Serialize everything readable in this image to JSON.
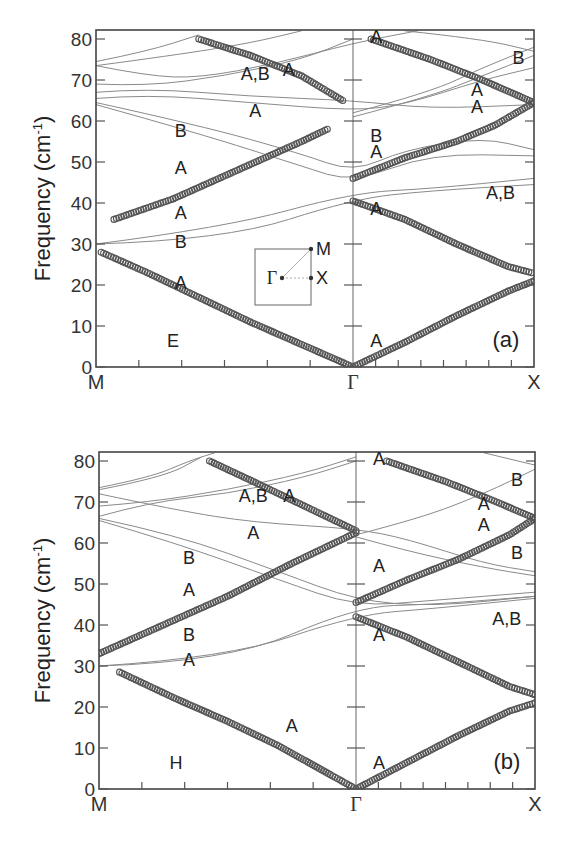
{
  "figure": {
    "caption_visible": false,
    "y_axis_label": "Frequency (cm",
    "y_axis_label_sup": "-1",
    "y_axis_label_close": ")",
    "y_ticks": [
      "0",
      "10",
      "20",
      "30",
      "40",
      "50",
      "60",
      "70",
      "80"
    ],
    "x_ticks": {
      "left": "M",
      "middle": "Γ",
      "right": "X"
    },
    "inset": {
      "gamma": "Γ",
      "m": "M",
      "x": "X"
    }
  },
  "chart_data": [
    {
      "type": "line",
      "title": "(a)",
      "panel_label": "(a)",
      "region_label": "E",
      "xlabel": "",
      "x_ticks": [
        "M",
        "Γ",
        "X"
      ],
      "ylabel": "Frequency (cm^-1)",
      "ylim": [
        0,
        82
      ],
      "grid": false,
      "legend": "none",
      "note": "Phonon dispersion; thick circle markers = highlighted modes, thin lines = other bands. x in [0,1] for M→Γ, [1,1.7] for Γ→X.",
      "highlighted_series": [
        {
          "name": "acoustic M-Γ (A)",
          "points": [
            [
              0.02,
              28
            ],
            [
              0.2,
              23
            ],
            [
              0.4,
              17
            ],
            [
              0.6,
              11
            ],
            [
              0.8,
              5.5
            ],
            [
              1.0,
              0
            ]
          ]
        },
        {
          "name": "acoustic Γ-X (A)",
          "points": [
            [
              1.0,
              0
            ],
            [
              1.2,
              6
            ],
            [
              1.4,
              12.5
            ],
            [
              1.6,
              18.5
            ],
            [
              1.7,
              21
            ]
          ]
        },
        {
          "name": "optic M-Γ lower (A)",
          "points": [
            [
              0.07,
              36
            ],
            [
              0.3,
              41
            ],
            [
              0.55,
              48
            ],
            [
              0.8,
              55
            ],
            [
              0.9,
              58
            ]
          ]
        },
        {
          "name": "optic M-Γ upper (A)",
          "points": [
            [
              0.4,
              80
            ],
            [
              0.6,
              76
            ],
            [
              0.8,
              71
            ],
            [
              0.96,
              65
            ]
          ]
        },
        {
          "name": "optic Γ-X descending (A)",
          "points": [
            [
              1.0,
              40.5
            ],
            [
              1.2,
              36
            ],
            [
              1.4,
              30
            ],
            [
              1.6,
              24.5
            ],
            [
              1.69,
              23
            ]
          ]
        },
        {
          "name": "optic Γ-X ascending (A)",
          "points": [
            [
              1.0,
              46
            ],
            [
              1.2,
              51
            ],
            [
              1.4,
              55
            ],
            [
              1.55,
              59
            ],
            [
              1.7,
              64.5
            ]
          ]
        },
        {
          "name": "optic Γ-X top (A)",
          "points": [
            [
              1.07,
              80
            ],
            [
              1.3,
              75
            ],
            [
              1.5,
              70
            ],
            [
              1.7,
              64.5
            ]
          ]
        }
      ],
      "band_labels": [
        {
          "text": "A,B",
          "x": 0.62,
          "y": 70
        },
        {
          "text": "A",
          "x": 0.75,
          "y": 71
        },
        {
          "text": "A",
          "x": 0.62,
          "y": 61
        },
        {
          "text": "B",
          "x": 0.33,
          "y": 56
        },
        {
          "text": "A",
          "x": 0.33,
          "y": 47
        },
        {
          "text": "A",
          "x": 0.33,
          "y": 36
        },
        {
          "text": "B",
          "x": 0.33,
          "y": 29
        },
        {
          "text": "A",
          "x": 0.33,
          "y": 19
        },
        {
          "text": "A",
          "x": 1.09,
          "y": 79
        },
        {
          "text": "B",
          "x": 1.64,
          "y": 74
        },
        {
          "text": "A",
          "x": 1.48,
          "y": 66
        },
        {
          "text": "A",
          "x": 1.48,
          "y": 62
        },
        {
          "text": "B",
          "x": 1.09,
          "y": 55
        },
        {
          "text": "A",
          "x": 1.09,
          "y": 51
        },
        {
          "text": "A,B",
          "x": 1.57,
          "y": 41
        },
        {
          "text": "A",
          "x": 1.09,
          "y": 37
        },
        {
          "text": "A",
          "x": 1.09,
          "y": 5
        }
      ]
    },
    {
      "type": "line",
      "title": "(b)",
      "panel_label": "(b)",
      "region_label": "H",
      "xlabel": "",
      "x_ticks": [
        "M",
        "Γ",
        "X"
      ],
      "ylabel": "Frequency (cm^-1)",
      "ylim": [
        0,
        82
      ],
      "grid": false,
      "legend": "none",
      "highlighted_series": [
        {
          "name": "acoustic M-Γ (A)",
          "points": [
            [
              0.08,
              28.5
            ],
            [
              0.3,
              22
            ],
            [
              0.5,
              16.5
            ],
            [
              0.7,
              10.5
            ],
            [
              0.9,
              3.5
            ],
            [
              1.0,
              0
            ]
          ]
        },
        {
          "name": "acoustic Γ-X (A)",
          "points": [
            [
              1.0,
              0
            ],
            [
              1.2,
              6.5
            ],
            [
              1.4,
              13
            ],
            [
              1.6,
              19
            ],
            [
              1.7,
              21
            ]
          ]
        },
        {
          "name": "optic M-Γ ascending (A)",
          "points": [
            [
              0.0,
              33
            ],
            [
              0.25,
              40
            ],
            [
              0.5,
              47
            ],
            [
              0.75,
              55
            ],
            [
              1.0,
              62.5
            ]
          ]
        },
        {
          "name": "optic M-Γ descending (A)",
          "points": [
            [
              0.43,
              80
            ],
            [
              0.6,
              75
            ],
            [
              0.8,
              69
            ],
            [
              1.0,
              63
            ]
          ]
        },
        {
          "name": "optic Γ-X descending (A)",
          "points": [
            [
              1.0,
              42
            ],
            [
              1.2,
              37
            ],
            [
              1.4,
              31
            ],
            [
              1.6,
              25
            ],
            [
              1.7,
              23
            ]
          ]
        },
        {
          "name": "optic Γ-X ascending (A)",
          "points": [
            [
              1.0,
              45.5
            ],
            [
              1.2,
              51
            ],
            [
              1.4,
              56
            ],
            [
              1.6,
              62
            ],
            [
              1.7,
              66
            ]
          ]
        },
        {
          "name": "optic Γ-X top (A)",
          "points": [
            [
              1.12,
              80
            ],
            [
              1.35,
              75
            ],
            [
              1.55,
              70
            ],
            [
              1.7,
              66
            ]
          ]
        }
      ],
      "band_labels": [
        {
          "text": "A,B",
          "x": 0.6,
          "y": 70
        },
        {
          "text": "A",
          "x": 0.74,
          "y": 70
        },
        {
          "text": "A",
          "x": 0.6,
          "y": 61
        },
        {
          "text": "B",
          "x": 0.35,
          "y": 55
        },
        {
          "text": "A",
          "x": 0.35,
          "y": 47
        },
        {
          "text": "B",
          "x": 0.35,
          "y": 36
        },
        {
          "text": "A",
          "x": 0.35,
          "y": 30
        },
        {
          "text": "A",
          "x": 0.75,
          "y": 14
        },
        {
          "text": "A",
          "x": 1.09,
          "y": 79
        },
        {
          "text": "B",
          "x": 1.63,
          "y": 74
        },
        {
          "text": "A",
          "x": 1.5,
          "y": 68
        },
        {
          "text": "A",
          "x": 1.5,
          "y": 63
        },
        {
          "text": "A",
          "x": 1.09,
          "y": 53
        },
        {
          "text": "B",
          "x": 1.63,
          "y": 56
        },
        {
          "text": "A,B",
          "x": 1.59,
          "y": 40
        },
        {
          "text": "A",
          "x": 1.09,
          "y": 36
        },
        {
          "text": "A",
          "x": 1.09,
          "y": 5
        }
      ]
    }
  ]
}
